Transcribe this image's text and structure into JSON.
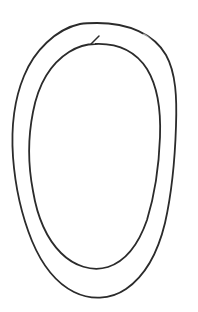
{
  "canvas": {
    "width": 198,
    "height": 312,
    "background_color": "#ffffff",
    "title": "hand-drawn double oval sketch"
  },
  "drawing": {
    "medium": "pen-line-drawing",
    "subject": "two nested hand-drawn ovals forming an open spiral",
    "ink_color": "#2b2b2b",
    "ink_color_light": "#6f6f6f",
    "stroke_width": 1.8,
    "stroke_width_light": 1.2,
    "stroke_width_tail": 1.5,
    "strokes": [
      {
        "name": "outer-oval-stroke",
        "label": "outer oval",
        "closed": true,
        "bounds": {
          "x_min": 13,
          "x_max": 176,
          "y_min": 23,
          "y_max": 298
        },
        "path": "M 97 23 C 128 23 154 34 166 55 C 176 73 177 98 176 126 C 175 158 172 192 165 223 C 158 252 145 276 126 289 C 110 300 90 300 74 292 C 56 283 42 265 32 241 C 21 214 15 184 13 157 C 11 128 14 100 24 76 C 34 51 56 29 80 24 C 86 23 92 23 97 23 Z"
      },
      {
        "name": "outer-oval-skip-overlay",
        "label": "pen skip on outer oval",
        "closed": false,
        "bounds": {
          "x_min": 143,
          "x_max": 158,
          "y_min": 35,
          "y_max": 50
        },
        "path": "M 144 35 C 149 38 153 43 157 49"
      },
      {
        "name": "inner-oval-stroke",
        "label": "inner oval",
        "closed": false,
        "bounds": {
          "x_min": 29,
          "x_max": 161,
          "y_min": 40,
          "y_max": 270
        },
        "path": "M 95 44 C 118 43 136 52 147 69 C 158 87 161 111 160 137 C 159 165 155 194 147 220 C 139 243 126 261 108 267 C 92 272 74 266 61 253 C 46 238 37 215 33 191 C 28 165 28 137 33 112 C 38 86 50 64 69 52 C 77 47 86 44 95 44 Z"
      },
      {
        "name": "inner-oval-start-tail",
        "label": "open end flick of inner oval",
        "closed": false,
        "bounds": {
          "x_min": 90,
          "x_max": 100,
          "y_min": 36,
          "y_max": 45
        },
        "path": "M 99 36 L 91 44"
      }
    ]
  }
}
